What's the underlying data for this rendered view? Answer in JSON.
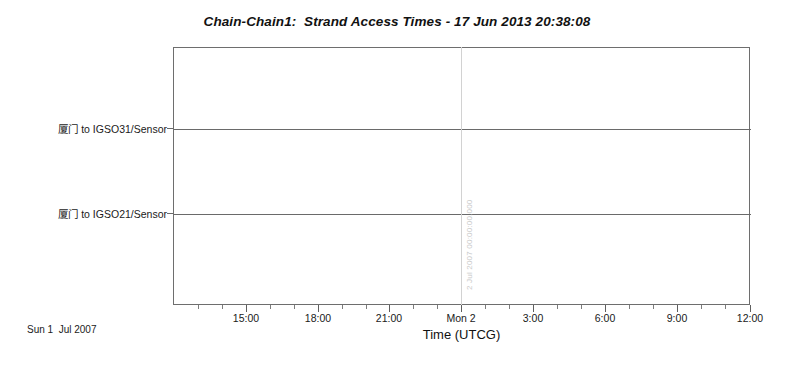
{
  "chart_data": {
    "type": "table",
    "title": "Chain-Chain1:  Strand Access Times - 17 Jun 2013 20:38:08",
    "xlabel": "Time (UTCG)",
    "ylabel": "",
    "grid": true,
    "legend": "none",
    "categories": [
      "厦门 to IGSO31/Sensor",
      "厦门 to IGSO21/Sensor"
    ],
    "series": [
      {
        "name": "厦门 to IGSO31/Sensor",
        "intervals": []
      },
      {
        "name": "厦门 to IGSO21/Sensor",
        "intervals": []
      }
    ],
    "x_tick_labels": [
      "15:00",
      "18:00",
      "21:00",
      "Mon 2",
      "3:00",
      "6:00",
      "9:00",
      "12:00"
    ],
    "x_tick_positions_px": [
      246,
      318,
      389,
      461,
      533,
      605,
      677,
      750
    ],
    "x_minor_tick_interval_hours": 1,
    "x_major_tick_interval_hours": 3,
    "xlim_labels": [
      "Sun 1 Jul 2007 13:00",
      "Mon 2 Jul 2007 12:00"
    ],
    "annotations": [
      {
        "name": "day-boundary",
        "label": "2 Jul 2007 00:00:00.000",
        "x_label": "Mon 2",
        "x_px": 461
      }
    ],
    "footer": "Sun 1  Jul 2007",
    "colors": {
      "background": "#ffffff",
      "frame": "#6e6e6e",
      "strand_line": "#6a6a6a",
      "gridline": "#d2d2d2",
      "text": "#1a1a1a",
      "annotation_text": "#c9c9c9"
    }
  },
  "chart": {
    "title": "Chain-Chain1:  Strand Access Times - 17 Jun 2013 20:38:08",
    "axis_title": "Time (UTCG)",
    "footer_date": "Sun 1  Jul 2007",
    "y_labels": [
      {
        "text": "厦门 to IGSO31/Sensor",
        "top_px": 121
      },
      {
        "text": "厦门 to IGSO21/Sensor",
        "top_px": 206
      }
    ],
    "x_ticks": [
      {
        "label": "15:00",
        "x": 246
      },
      {
        "label": "18:00",
        "x": 318
      },
      {
        "label": "21:00",
        "x": 389
      },
      {
        "label": "Mon 2",
        "x": 461
      },
      {
        "label": "3:00",
        "x": 533
      },
      {
        "label": "6:00",
        "x": 605
      },
      {
        "label": "9:00",
        "x": 677
      },
      {
        "label": "12:00",
        "x": 750
      }
    ],
    "x_minor_ticks": [
      198,
      222,
      270,
      294,
      342,
      366,
      413,
      437,
      485,
      509,
      557,
      581,
      629,
      653,
      701,
      725
    ],
    "gridline": {
      "x": 461,
      "label": "2 Jul 2007 00:00:00.000",
      "label_x": 465,
      "label_y": 290
    }
  }
}
